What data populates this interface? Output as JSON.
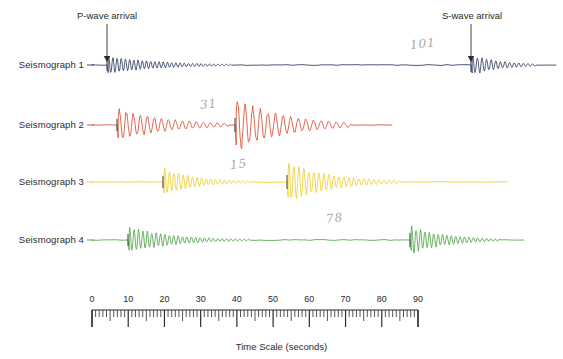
{
  "figure": {
    "title_bottom": "Time Scale (seconds)",
    "background": "#ffffff"
  },
  "annotations": {
    "p_wave": "P-wave arrival",
    "s_wave": "S-wave arrival",
    "handwritten": [
      {
        "text": "101",
        "x": 410,
        "y": 38
      },
      {
        "text": "31",
        "x": 200,
        "y": 98
      },
      {
        "text": "15",
        "x": 230,
        "y": 158
      },
      {
        "text": "78",
        "x": 326,
        "y": 212
      }
    ]
  },
  "traces": [
    {
      "label": "Seismograph 1",
      "color": "#3d4a6b",
      "p_arrival_s": 4,
      "s_arrival_s": 101,
      "row_y": 65
    },
    {
      "label": "Seismograph 2",
      "color": "#e0553c",
      "p_arrival_s": 10,
      "s_arrival_s": 41,
      "row_y": 125
    },
    {
      "label": "Seismograph 3",
      "color": "#f2d03c",
      "p_arrival_s": 22,
      "s_arrival_s": 54,
      "row_y": 182
    },
    {
      "label": "Seismograph 4",
      "color": "#5aad54",
      "p_arrival_s": 24,
      "s_arrival_s": 90,
      "row_y": 240
    }
  ],
  "time_scale": {
    "unit": "seconds",
    "min": 0,
    "max": 90,
    "major_step": 10,
    "minor_step": 1,
    "labels": [
      "0",
      "10",
      "20",
      "30",
      "40",
      "50",
      "60",
      "70",
      "80",
      "90"
    ],
    "caption": "Time Scale (seconds)",
    "px_start": 92,
    "px_end": 418
  },
  "chart_data": {
    "type": "line",
    "title": "",
    "xlabel": "Time Scale (seconds)",
    "ylabel": "",
    "xlim": [
      0,
      90
    ],
    "grid": false,
    "legend": "left-labels",
    "series": [
      {
        "name": "Seismograph 1",
        "color": "#3d4a6b",
        "p_wave_arrival": 4,
        "s_wave_arrival": 101,
        "p_amplitude": 8,
        "s_amplitude": 9,
        "baseline_y": 65
      },
      {
        "name": "Seismograph 2",
        "color": "#e0553c",
        "p_wave_arrival": 10,
        "s_wave_arrival": 41,
        "p_amplitude": 14,
        "s_amplitude": 24,
        "baseline_y": 125
      },
      {
        "name": "Seismograph 3",
        "color": "#f2d03c",
        "p_wave_arrival": 22,
        "s_wave_arrival": 54,
        "p_amplitude": 12,
        "s_amplitude": 18,
        "baseline_y": 182
      },
      {
        "name": "Seismograph 4",
        "color": "#5aad54",
        "p_wave_arrival": 24,
        "s_wave_arrival": 90,
        "p_amplitude": 11,
        "s_amplitude": 12,
        "baseline_y": 240
      }
    ]
  }
}
